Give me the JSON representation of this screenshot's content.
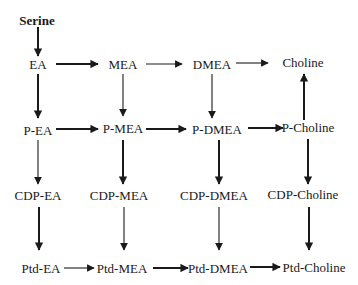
{
  "diagram": {
    "type": "metabolic-pathway",
    "nodes": {
      "serine": "Serine",
      "ea": "EA",
      "mea": "MEA",
      "dmea": "DMEA",
      "choline": "Choline",
      "p_ea": "P-EA",
      "p_mea": "P-MEA",
      "p_dmea": "P-DMEA",
      "p_choline": "P-Choline",
      "cdp_ea": "CDP-EA",
      "cdp_mea": "CDP-MEA",
      "cdp_dmea": "CDP-DMEA",
      "cdp_choline": "CDP-Choline",
      "ptd_ea": "Ptd-EA",
      "ptd_mea": "Ptd-MEA",
      "ptd_dmea": "Ptd-DMEA",
      "ptd_choline": "Ptd-Choline"
    },
    "edges": [
      {
        "from": "Serine",
        "to": "EA",
        "weight": "thick"
      },
      {
        "from": "EA",
        "to": "MEA",
        "weight": "thick"
      },
      {
        "from": "MEA",
        "to": "DMEA",
        "weight": "thin"
      },
      {
        "from": "DMEA",
        "to": "Choline",
        "weight": "thin"
      },
      {
        "from": "EA",
        "to": "P-EA",
        "weight": "thick"
      },
      {
        "from": "MEA",
        "to": "P-MEA",
        "weight": "thin"
      },
      {
        "from": "DMEA",
        "to": "P-DMEA",
        "weight": "thin"
      },
      {
        "from": "P-Choline",
        "to": "Choline",
        "weight": "thick"
      },
      {
        "from": "P-EA",
        "to": "P-MEA",
        "weight": "thick"
      },
      {
        "from": "P-MEA",
        "to": "P-DMEA",
        "weight": "thick"
      },
      {
        "from": "P-DMEA",
        "to": "P-Choline",
        "weight": "thick"
      },
      {
        "from": "P-EA",
        "to": "CDP-EA",
        "weight": "thin"
      },
      {
        "from": "P-MEA",
        "to": "CDP-MEA",
        "weight": "thick"
      },
      {
        "from": "P-DMEA",
        "to": "CDP-DMEA",
        "weight": "thick"
      },
      {
        "from": "P-Choline",
        "to": "CDP-Choline",
        "weight": "thick"
      },
      {
        "from": "CDP-EA",
        "to": "Ptd-EA",
        "weight": "thick"
      },
      {
        "from": "CDP-MEA",
        "to": "Ptd-MEA",
        "weight": "thin"
      },
      {
        "from": "CDP-DMEA",
        "to": "Ptd-DMEA",
        "weight": "thin"
      },
      {
        "from": "CDP-Choline",
        "to": "Ptd-Choline",
        "weight": "thick"
      },
      {
        "from": "Ptd-EA",
        "to": "Ptd-MEA",
        "weight": "thin"
      },
      {
        "from": "Ptd-MEA",
        "to": "Ptd-DMEA",
        "weight": "thick"
      },
      {
        "from": "Ptd-DMEA",
        "to": "Ptd-Choline",
        "weight": "thick"
      }
    ],
    "colors": {
      "ink": "#1a1a1a",
      "background": "#ffffff"
    }
  }
}
